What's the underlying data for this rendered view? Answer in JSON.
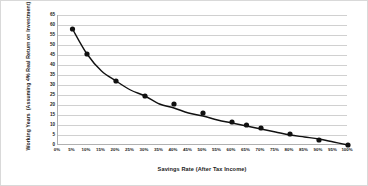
{
  "chart_data": {
    "type": "line",
    "title": "",
    "xlabel": "Savings Rate (After Tax Income)",
    "ylabel_line1": "Working Years",
    "ylabel_line2": "(Assuming 4% Real Return on Investment)",
    "xlim": [
      0,
      100
    ],
    "ylim": [
      0,
      65
    ],
    "grid": true,
    "legend": "none",
    "marker": "filled-circle",
    "line_color": "#111111",
    "marker_color": "#111111",
    "grid_color": "#d0d0d0",
    "axis_color": "#b0b0b0",
    "xticks": [
      "0%",
      "5%",
      "10%",
      "15%",
      "20%",
      "25%",
      "30%",
      "35%",
      "40%",
      "45%",
      "50%",
      "55%",
      "60%",
      "65%",
      "70%",
      "75%",
      "80%",
      "85%",
      "90%",
      "95%",
      "100%"
    ],
    "xtick_values": [
      0,
      5,
      10,
      15,
      20,
      25,
      30,
      35,
      40,
      45,
      50,
      55,
      60,
      65,
      70,
      75,
      80,
      85,
      90,
      95,
      100
    ],
    "yticks": [
      "0",
      "5",
      "10",
      "15",
      "20",
      "25",
      "30",
      "35",
      "40",
      "45",
      "50",
      "55",
      "60",
      "65"
    ],
    "ytick_values": [
      0,
      5,
      10,
      15,
      20,
      25,
      30,
      35,
      40,
      45,
      50,
      55,
      60,
      65
    ],
    "x": [
      5,
      10,
      15,
      20,
      25,
      30,
      35,
      40,
      45,
      50,
      55,
      60,
      65,
      70,
      75,
      80,
      85,
      90,
      95,
      100
    ],
    "values": [
      58,
      45.5,
      37,
      32,
      27.5,
      24.5,
      20.5,
      18.5,
      16,
      14.5,
      12.5,
      11,
      9.5,
      8,
      6.5,
      5,
      4,
      3,
      1.5,
      0
    ],
    "series": [
      {
        "name": "Working Years",
        "x": [
          5,
          10,
          15,
          20,
          25,
          30,
          35,
          40,
          45,
          50,
          55,
          60,
          65,
          70,
          75,
          80,
          85,
          90,
          95,
          100
        ],
        "values": [
          58,
          45.5,
          37,
          32,
          27.5,
          24.5,
          20.5,
          18.5,
          16,
          14.5,
          12.5,
          11,
          9.5,
          8,
          6.5,
          5,
          4,
          3,
          1.5,
          0
        ]
      }
    ],
    "markers_shown_x": [
      5,
      10,
      20,
      30,
      40,
      50,
      60,
      65,
      70,
      80,
      90,
      100
    ],
    "markers_shown_values": [
      58,
      45.5,
      32,
      24.5,
      20.5,
      16,
      11.5,
      10,
      8.5,
      5.5,
      2.5,
      0
    ]
  }
}
